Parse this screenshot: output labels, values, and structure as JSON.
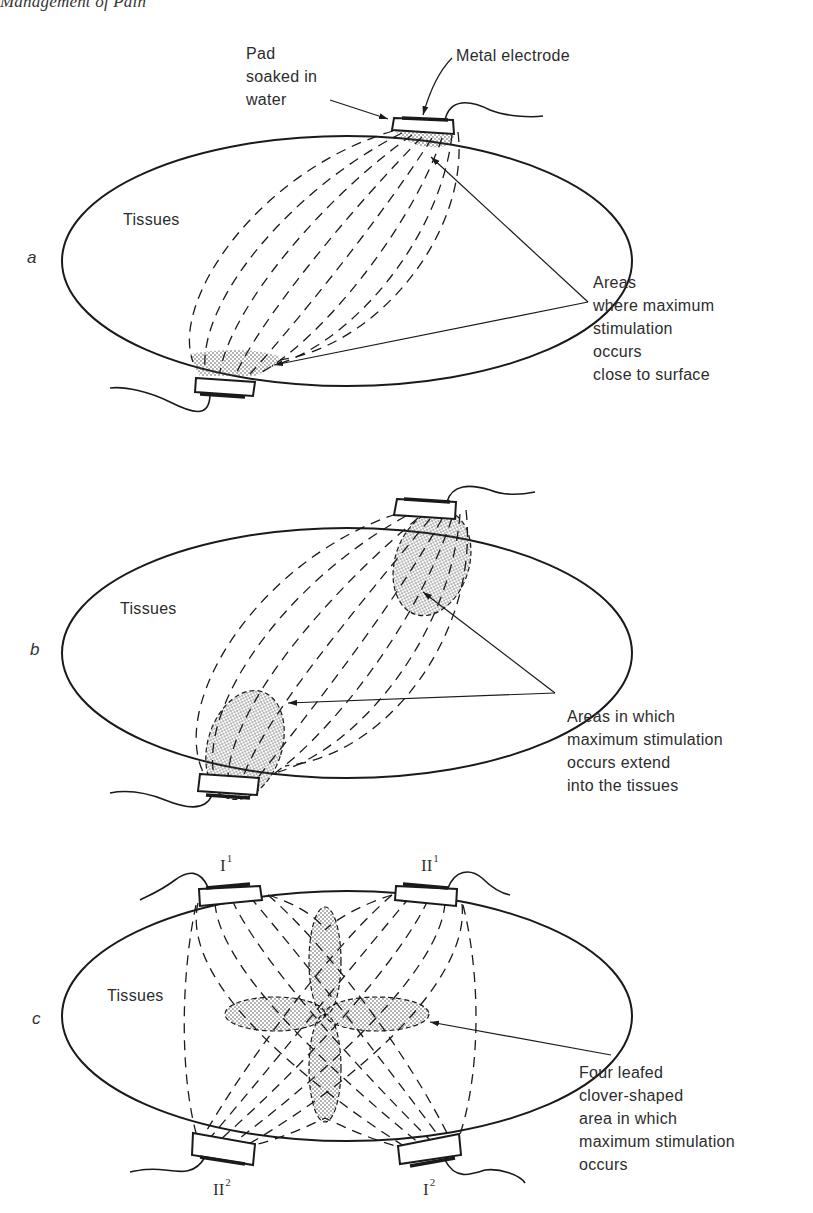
{
  "running_head": "Management of Pain",
  "panels": [
    {
      "letter": "a",
      "tissue_label": "Tissues",
      "annotations": {
        "pad": "Pad\nsoaked in\nwater",
        "electrode": "Metal electrode",
        "areas": "Areas\nwhere maximum\nstimulation\noccurs\nclose to surface"
      }
    },
    {
      "letter": "b",
      "tissue_label": "Tissues",
      "annotations": {
        "areas": "Areas in which\nmaximum stimulation\noccurs extend\ninto the tissues"
      }
    },
    {
      "letter": "c",
      "tissue_label": "Tissues",
      "electrodes": {
        "top_left": {
          "numeral": "I",
          "sup": "1"
        },
        "top_right": {
          "numeral": "II",
          "sup": "1"
        },
        "bottom_left": {
          "numeral": "II",
          "sup": "2"
        },
        "bottom_right": {
          "numeral": "I",
          "sup": "2"
        }
      },
      "annotations": {
        "clover": "Four leafed\nclover-shaped\narea in which\nmaximum stimulation\noccurs"
      }
    }
  ],
  "colors": {
    "ink": "#1a1a1a",
    "stipple": "#555555",
    "paper": "#ffffff"
  }
}
